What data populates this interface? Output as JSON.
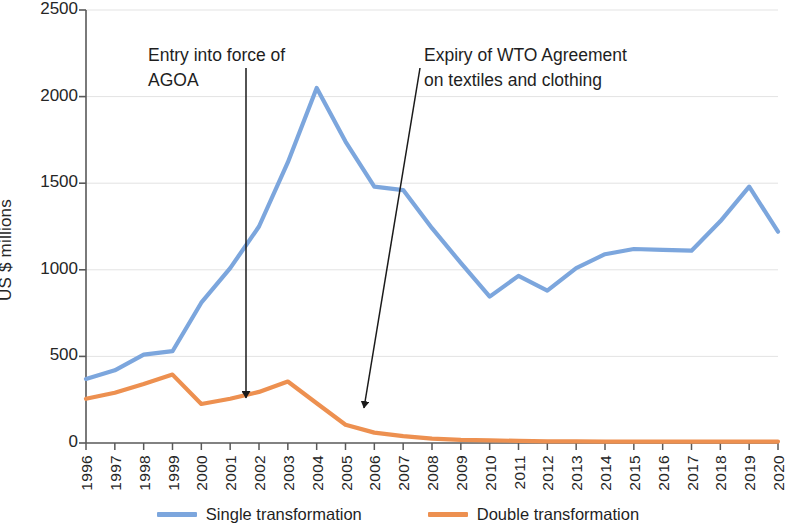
{
  "chart_data": {
    "type": "line",
    "title": "",
    "xlabel": "",
    "ylabel": "US $ millions",
    "ylim": [
      0,
      2500
    ],
    "yticks": [
      0,
      500,
      1000,
      1500,
      2000,
      2500
    ],
    "grid": true,
    "legend_position": "bottom",
    "categories": [
      "1996",
      "1997",
      "1998",
      "1999",
      "2000",
      "2001",
      "2002",
      "2003",
      "2004",
      "2005",
      "2006",
      "2007",
      "2008",
      "2009",
      "2010",
      "2011",
      "2012",
      "2013",
      "2014",
      "2015",
      "2016",
      "2017",
      "2018",
      "2019",
      "2020"
    ],
    "series": [
      {
        "name": "Single transformation",
        "color": "#7CA6DD",
        "values": [
          370,
          420,
          510,
          530,
          810,
          1010,
          1250,
          1620,
          2050,
          1740,
          1480,
          1460,
          1240,
          1040,
          845,
          965,
          880,
          1010,
          1090,
          1120,
          1115,
          1110,
          1280,
          1480,
          1220
        ]
      },
      {
        "name": "Double transformation",
        "color": "#ED9050",
        "values": [
          255,
          290,
          340,
          395,
          225,
          255,
          295,
          355,
          230,
          105,
          60,
          40,
          25,
          18,
          15,
          12,
          10,
          10,
          8,
          8,
          8,
          8,
          8,
          8,
          8
        ]
      }
    ],
    "annotations": [
      {
        "id": "agoa",
        "text": "Entry into force of\nAGOA",
        "points_to_year": "2001",
        "points_to_value": 250
      },
      {
        "id": "wto-expiry",
        "text": "Expiry of WTO Agreement\non textiles and clothing",
        "points_to_year": "2005",
        "points_to_value": 120
      }
    ]
  },
  "legend": {
    "items": [
      {
        "label": "Single transformation",
        "color": "#7CA6DD"
      },
      {
        "label": "Double transformation",
        "color": "#ED9050"
      }
    ]
  },
  "axis": {
    "y_title": "US $ millions",
    "y_tick_labels": [
      "0",
      "500",
      "1000",
      "1500",
      "2000",
      "2500"
    ],
    "x_tick_labels": [
      "1996",
      "1997",
      "1998",
      "1999",
      "2000",
      "2001",
      "2002",
      "2003",
      "2004",
      "2005",
      "2006",
      "2007",
      "2008",
      "2009",
      "2010",
      "2011",
      "2012",
      "2013",
      "2014",
      "2015",
      "2016",
      "2017",
      "2018",
      "2019",
      "2020"
    ]
  },
  "annotations": {
    "agoa": "Entry into force of\nAGOA",
    "wto": "Expiry of WTO Agreement\non textiles and clothing"
  }
}
